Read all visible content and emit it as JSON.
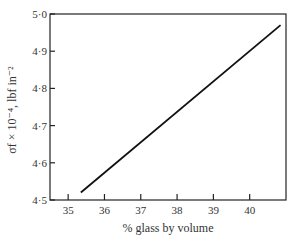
{
  "chart_data": {
    "type": "line",
    "title": "",
    "xlabel": "% glass by volume",
    "ylabel": "σf × 10⁻⁴, lbf in⁻²",
    "xlim": [
      34.5,
      41.0
    ],
    "ylim": [
      4.5,
      5.0
    ],
    "x_ticks": [
      "35",
      "36",
      "37",
      "38",
      "39",
      "40"
    ],
    "y_ticks": [
      "4·5",
      "4·6",
      "4·7",
      "4·8",
      "4·9",
      "5·0"
    ],
    "grid": false,
    "series": [
      {
        "name": "σf vs glass content",
        "x": [
          35.35,
          40.85
        ],
        "y": [
          4.52,
          4.97
        ]
      }
    ]
  }
}
